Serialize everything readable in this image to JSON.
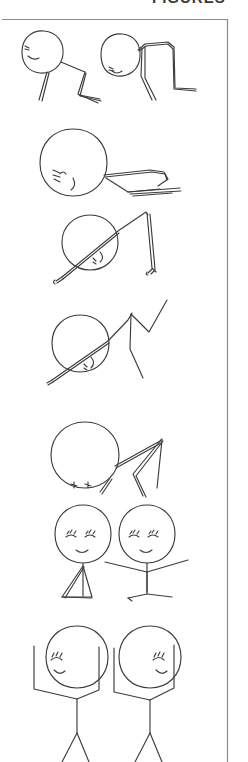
{
  "page": {
    "width": 248,
    "height": 762,
    "background_color": "#ffffff",
    "ink_color": "#3c3c3c",
    "frame_color": "#8a8a8a",
    "title_partial": "FIGURES",
    "title_note": "cropped at top edge, only lower pixel row of letters visible"
  },
  "frame": {
    "name": "page-border",
    "left": 2,
    "top": 19,
    "right": 228,
    "bottom": 762,
    "stroke_width": 1.2
  },
  "panels": [
    {
      "index": 1,
      "name": "panel-lying-pair",
      "description": "Two stick figures lying prone, heads at left, bent legs trailing right",
      "figure_count": 2,
      "pose": "prone / lying down",
      "face": "side profile with closed eye and smile"
    },
    {
      "index": 2,
      "name": "panel-big-head-flat",
      "description": "Large round head with flattened body extending right along the ground",
      "figure_count": 1,
      "pose": "flat on ground",
      "face": "closed eyes and small mouth near lower left of head"
    },
    {
      "index": 3,
      "name": "panel-tilted-head-legs-up",
      "description": "Circle head crossed by a diagonal body line, thin legs bent upward at right",
      "figure_count": 1,
      "pose": "rolling / inverted",
      "face": "small closed eye mark inside circle"
    },
    {
      "index": 4,
      "name": "panel-zigzag-limb",
      "description": "Circle head with diagonal torso and zigzag arm rising to upper right",
      "figure_count": 1,
      "pose": "pushing up",
      "face": "small eye mark at lower right of circle"
    },
    {
      "index": 5,
      "name": "panel-arms-raised-prone",
      "description": "Round head on ground with a sharp chevron arm pointing up and right",
      "figure_count": 1,
      "pose": "prone, arms chevroned",
      "face": "two short closed-eye strokes at the bottom of the head"
    },
    {
      "index": 6,
      "name": "panel-seated-pair",
      "description": "Two figures upright, left with arms folded into a triangle, right with arms spread wide",
      "figure_count": 2,
      "pose": "kneeling / seated upright",
      "face": "closed eyes with lashes and a small smile"
    },
    {
      "index": 7,
      "name": "panel-standing-pair",
      "description": "Two standing figures with both arms raised in bracket shapes, legs splayed, cropped at bottom edge",
      "figure_count": 2,
      "pose": "standing, arms up",
      "face": "profile with closed lashed eye and smile"
    }
  ],
  "summary": {
    "total_figures": 10,
    "style": "hand-drawn pencil stick figures",
    "sequence_reading": "top to bottom, showing a figure progressively rising from lying down to standing"
  }
}
